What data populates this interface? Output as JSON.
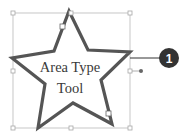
{
  "figure": {
    "text_line_1": "Area Type",
    "text_line_2": "Tool",
    "callout_number": "1"
  },
  "colors": {
    "star_stroke": "#555555",
    "bbox_stroke": "#b0b0b0",
    "callout_fill": "#333333",
    "text": "#3a3a3a"
  }
}
